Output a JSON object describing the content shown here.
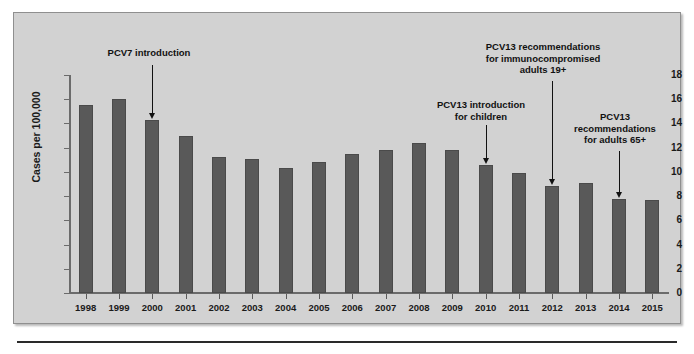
{
  "figure": {
    "background_color": "#d2d2d2",
    "bar_color": "#595959",
    "axis_color": "#6b6b6b"
  },
  "chart_data": {
    "type": "bar",
    "title": "",
    "xlabel": "",
    "ylabel": "Cases per 100,000",
    "ylim": [
      0,
      18
    ],
    "yticks": [
      0,
      2,
      4,
      6,
      8,
      10,
      12,
      14,
      16,
      18
    ],
    "grid": false,
    "legend": null,
    "categories": [
      "1998",
      "1999",
      "2000",
      "2001",
      "2002",
      "2003",
      "2004",
      "2005",
      "2006",
      "2007",
      "2008",
      "2009",
      "2010",
      "2011",
      "2012",
      "2013",
      "2014",
      "2015"
    ],
    "values": [
      15.5,
      16.0,
      14.3,
      13.0,
      11.2,
      11.1,
      10.3,
      10.8,
      11.5,
      11.8,
      12.4,
      11.8,
      10.6,
      9.9,
      8.8,
      9.1,
      7.8,
      7.7
    ],
    "annotations": [
      {
        "text": "PCV7 introduction",
        "target_category": "2000"
      },
      {
        "text": "PCV13 introduction\nfor children",
        "target_category": "2010"
      },
      {
        "text": "PCV13 recommendations\nfor immunocompromised\nadults 19+",
        "target_category": "2012"
      },
      {
        "text": "PCV13\nrecommendations\nfor adults 65+",
        "target_category": "2014"
      }
    ]
  }
}
